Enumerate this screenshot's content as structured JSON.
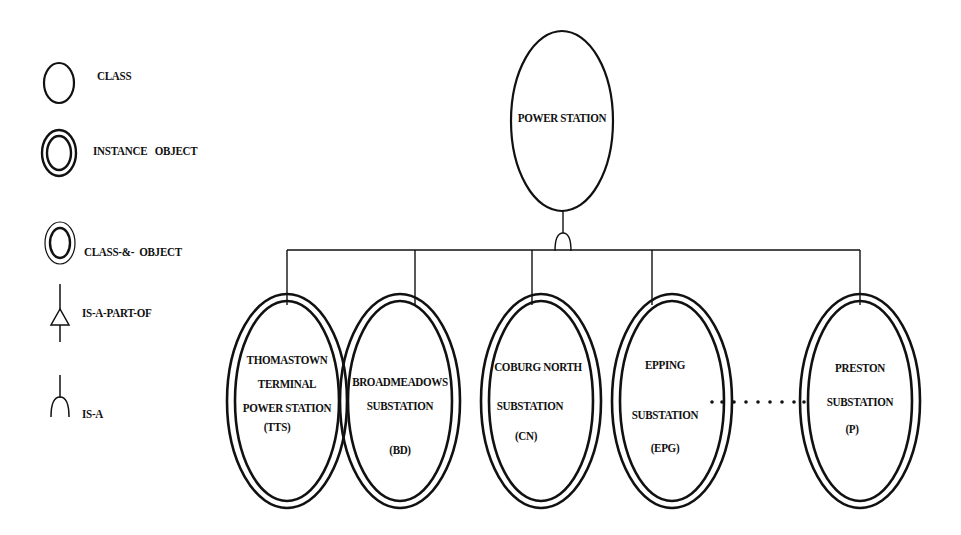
{
  "legend": {
    "items": [
      {
        "symbol": "single-ellipse",
        "label": "CLASS"
      },
      {
        "symbol": "double-ellipse-thick",
        "label": "INSTANCE   OBJECT"
      },
      {
        "symbol": "double-ellipse-thin",
        "label": "CLASS-&-  OBJECT"
      },
      {
        "symbol": "triangle-connector",
        "label": "IS-A-PART-OF"
      },
      {
        "symbol": "arc-connector",
        "label": "IS-A"
      }
    ]
  },
  "root": {
    "label": "POWER STATION",
    "type": "class"
  },
  "relationship": "IS-A",
  "children": [
    {
      "lines": [
        "THOMASTOWN",
        "TERMINAL",
        "POWER STATION",
        "(TTS)"
      ],
      "type": "instance-object"
    },
    {
      "lines": [
        "BROADMEADOWS",
        "SUBSTATION",
        "",
        "(BD)"
      ],
      "type": "instance-object"
    },
    {
      "lines": [
        "COBURG NORTH",
        "SUBSTATION",
        "(CN)"
      ],
      "type": "instance-object"
    },
    {
      "lines": [
        "EPPING",
        "SUBSTATION",
        "(EPG)"
      ],
      "type": "instance-object"
    },
    {
      "lines": [
        "PRESTON",
        "SUBSTATION",
        "(P)"
      ],
      "type": "instance-object"
    }
  ],
  "ellipsis_between": [
    "EPG",
    "P"
  ],
  "colors": {
    "stroke": "#111111",
    "background": "#ffffff"
  }
}
